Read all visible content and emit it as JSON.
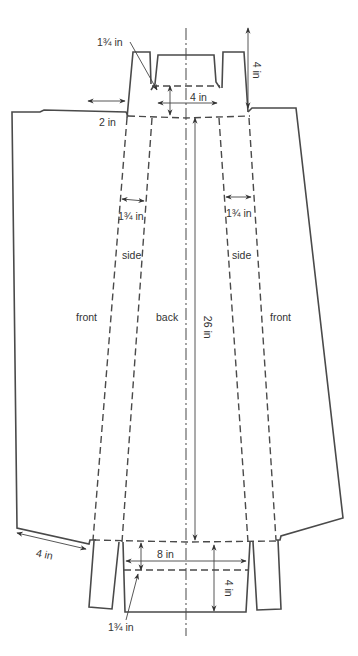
{
  "diagram": {
    "type": "sewing-pattern",
    "pieces": {
      "front_left": "front",
      "side_left": "side",
      "back": "back",
      "side_right": "side",
      "front_right": "front"
    },
    "dimensions": {
      "top_waistband_depth": "1¾ in",
      "top_center_width": "4 in",
      "top_tab_height": "4 in",
      "front_top_width": "2 in",
      "side_left_width": "1¾ in",
      "side_right_width": "1¾ in",
      "length": "26 in",
      "front_hem_width": "4 in",
      "bottom_center_width": "8 in",
      "bottom_tab_height": "4 in",
      "bottom_band_depth": "1¾ in"
    },
    "colors": {
      "line": "#4a4a4a",
      "background": "#ffffff"
    }
  }
}
